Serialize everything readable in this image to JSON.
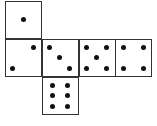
{
  "diagram": {
    "type": "dice-net",
    "faces": [
      {
        "name": "one",
        "value": 1,
        "col": 0,
        "row": 0,
        "pips": [
          [
            0.5,
            0.5
          ]
        ]
      },
      {
        "name": "two",
        "value": 2,
        "col": 0,
        "row": 1,
        "pips": [
          [
            0.8,
            0.2
          ],
          [
            0.2,
            0.8
          ]
        ]
      },
      {
        "name": "three",
        "value": 3,
        "col": 1,
        "row": 1,
        "pips": [
          [
            0.2,
            0.2
          ],
          [
            0.5,
            0.5
          ],
          [
            0.8,
            0.8
          ]
        ]
      },
      {
        "name": "five",
        "value": 5,
        "col": 2,
        "row": 1,
        "pips": [
          [
            0.2,
            0.2
          ],
          [
            0.8,
            0.2
          ],
          [
            0.5,
            0.5
          ],
          [
            0.2,
            0.8
          ],
          [
            0.8,
            0.8
          ]
        ]
      },
      {
        "name": "four",
        "value": 4,
        "col": 3,
        "row": 1,
        "pips": [
          [
            0.2,
            0.2
          ],
          [
            0.8,
            0.2
          ],
          [
            0.2,
            0.8
          ],
          [
            0.8,
            0.8
          ]
        ]
      },
      {
        "name": "six",
        "value": 6,
        "col": 1,
        "row": 2,
        "pips": [
          [
            0.28,
            0.2
          ],
          [
            0.72,
            0.2
          ],
          [
            0.28,
            0.5
          ],
          [
            0.72,
            0.5
          ],
          [
            0.28,
            0.8
          ],
          [
            0.72,
            0.8
          ]
        ]
      }
    ],
    "colors": {
      "border": "#333333",
      "pip": "#111111",
      "background": "#ffffff"
    }
  }
}
